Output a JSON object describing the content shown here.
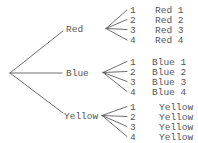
{
  "diagram": {
    "type": "tree",
    "colors": {
      "line": "#5e5e5e",
      "text": "#55555a",
      "background": "#ffffff"
    },
    "branches": [
      {
        "label": "Red",
        "children": [
          {
            "number": "1",
            "outcome": "Red 1"
          },
          {
            "number": "2",
            "outcome": "Red 2"
          },
          {
            "number": "3",
            "outcome": "Red 3"
          },
          {
            "number": "4",
            "outcome": "Red 4"
          }
        ]
      },
      {
        "label": "Blue",
        "children": [
          {
            "number": "1",
            "outcome": "Blue 1"
          },
          {
            "number": "2",
            "outcome": "Blue 2"
          },
          {
            "number": "3",
            "outcome": "Blue 3"
          },
          {
            "number": "4",
            "outcome": "Blue 4"
          }
        ]
      },
      {
        "label": "Yellow",
        "children": [
          {
            "number": "1",
            "outcome": "Yellow"
          },
          {
            "number": "2",
            "outcome": "Yellow"
          },
          {
            "number": "3",
            "outcome": "Yellow"
          },
          {
            "number": "4",
            "outcome": "Yellow"
          }
        ]
      }
    ]
  }
}
